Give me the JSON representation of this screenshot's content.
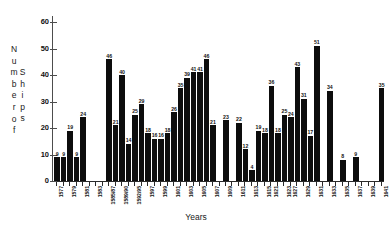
{
  "chart_data": {
    "type": "bar",
    "title": "",
    "xlabel": "Years",
    "ylabel": "Number of Ships",
    "ylabel_columns": [
      "Number of",
      "Ships"
    ],
    "ylim": [
      0,
      60
    ],
    "yticks": [
      0,
      10,
      20,
      30,
      40,
      50,
      60
    ],
    "grid": false,
    "legend": null,
    "bar_color": "#0d0d0d",
    "axis_color": "#2b2b2b",
    "categories": [
      "1577",
      "1578",
      "1579",
      "1580",
      "1581",
      "1582",
      "1583",
      "1584",
      "1585/87",
      "1588",
      "1589/90",
      "1591",
      "1592/95",
      "1596",
      "1597",
      "1598",
      "1599",
      "1600",
      "1601",
      "1602",
      "1603",
      "1604",
      "1605",
      "1606",
      "1607",
      "1608",
      "1609",
      "1610",
      "1611",
      "1612",
      "1613",
      "1614",
      "1615",
      "1621",
      "1622",
      "1623",
      "1627",
      "1628",
      "1629",
      "1630",
      "1631",
      "1632",
      "1633",
      "1634",
      "1635",
      "1636",
      "1637",
      "1638",
      "1639",
      "1640",
      "1641"
    ],
    "tick_labels_shown": [
      "1577",
      "1579",
      "1581",
      "1583",
      "1585/87",
      "1589/90",
      "1592/95",
      "1597",
      "1599",
      "1601",
      "1603",
      "1605",
      "1607",
      "1609",
      "1611",
      "1613",
      "1615",
      "1621",
      "1623",
      "1627",
      "1629",
      "1631",
      "1633",
      "1635",
      "1637",
      "1639",
      "1641"
    ],
    "values": [
      9,
      9,
      19,
      9,
      24,
      0,
      0,
      0,
      46,
      21,
      40,
      14,
      25,
      29,
      18,
      16,
      16,
      18,
      26,
      35,
      39,
      41,
      41,
      46,
      21,
      0,
      23,
      0,
      22,
      12,
      4,
      19,
      18,
      36,
      18,
      25,
      24,
      43,
      31,
      17,
      51,
      34,
      8,
      9,
      35,
      0,
      0,
      0,
      0,
      0,
      0
    ],
    "bars": [
      {
        "label": "1577",
        "value": 9
      },
      {
        "label": "1578",
        "value": 9
      },
      {
        "label": "1579",
        "value": 19
      },
      {
        "label": "1580",
        "value": 9
      },
      {
        "label": "1581",
        "value": 24
      },
      {
        "label": "1585/87",
        "value": 46
      },
      {
        "label": "1588",
        "value": 21
      },
      {
        "label": "1589/90",
        "value": 40
      },
      {
        "label": "1591",
        "value": 14
      },
      {
        "label": "1592/95",
        "value": 25
      },
      {
        "label": "1596",
        "value": 29
      },
      {
        "label": "1597",
        "value": 18
      },
      {
        "label": "1598",
        "value": 16
      },
      {
        "label": "1599",
        "value": 16
      },
      {
        "label": "1600",
        "value": 18
      },
      {
        "label": "1601",
        "value": 26
      },
      {
        "label": "1602",
        "value": 35
      },
      {
        "label": "1603",
        "value": 39
      },
      {
        "label": "1604",
        "value": 41
      },
      {
        "label": "1605",
        "value": 41
      },
      {
        "label": "1606",
        "value": 46
      },
      {
        "label": "1607",
        "value": 21
      },
      {
        "label": "1609",
        "value": 23
      },
      {
        "label": "1611",
        "value": 22
      },
      {
        "label": "1612",
        "value": 12
      },
      {
        "label": "1613",
        "value": 4
      },
      {
        "label": "1614",
        "value": 19
      },
      {
        "label": "1615",
        "value": 18
      },
      {
        "label": "1621",
        "value": 36
      },
      {
        "label": "1622",
        "value": 18
      },
      {
        "label": "1623",
        "value": 25
      },
      {
        "label": "1627",
        "value": 24
      },
      {
        "label": "1628",
        "value": 43
      },
      {
        "label": "1629",
        "value": 31
      },
      {
        "label": "1630",
        "value": 17
      },
      {
        "label": "1631",
        "value": 51
      },
      {
        "label": "1633",
        "value": 34
      },
      {
        "label": "1635",
        "value": 8
      },
      {
        "label": "1637",
        "value": 9
      },
      {
        "label": "1641",
        "value": 35
      }
    ]
  }
}
